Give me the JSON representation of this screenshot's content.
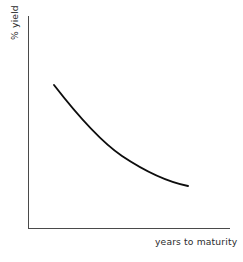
{
  "figure": {
    "width": 243,
    "height": 262,
    "background_color": "#ffffff"
  },
  "chart_data": {
    "type": "line",
    "title": "",
    "subtitle": "",
    "xlabel": "years to maturity",
    "ylabel": "% yield",
    "grid": false,
    "legend": null,
    "annotations": [],
    "axis_color": "#4a4a4a",
    "line_color": "#0d0d0d",
    "xlim": [
      0,
      10
    ],
    "ylim": [
      0,
      10
    ],
    "xticks": [],
    "yticks": [],
    "xticklabels": [],
    "yticklabels": [],
    "series": [
      {
        "name": "yield curve",
        "x": [
          1.3,
          2.0,
          2.6,
          3.3,
          4.0,
          4.6,
          5.3,
          6.0,
          6.6,
          7.3,
          7.9
        ],
        "y": [
          7.1,
          6.4,
          5.8,
          5.3,
          4.8,
          4.4,
          4.0,
          3.7,
          3.5,
          3.35,
          3.3
        ]
      }
    ],
    "pixel_geometry": {
      "y_axis_x": 28,
      "y_axis_top": 16,
      "x_axis_y": 228,
      "x_axis_right": 230,
      "curve_start": [
        54,
        85
      ],
      "curve_end": [
        188,
        186
      ],
      "curve_path": "M 54 85 C 78 116, 100 141, 122 156 C 146 172, 168 182, 188 186"
    }
  },
  "labels": {
    "x_axis_label": "years to maturity",
    "y_axis_label": "% yield"
  }
}
